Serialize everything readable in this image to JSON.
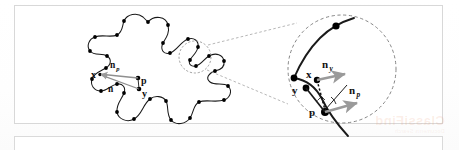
{
  "figure": {
    "caption_visible": false,
    "background_color": "#ffffff",
    "frame_color": "#d8d8d8",
    "curve_color": "#111111",
    "control_point_color": "#000000",
    "arrow_color": "#8f8f8f",
    "dashed_color": "#7a7a7a",
    "left_shape": {
      "name": "closed-spline-blob",
      "labels": [
        {
          "id": "x",
          "text": "x",
          "sub": "",
          "x": 93,
          "y": 74
        },
        {
          "id": "np",
          "text": "n",
          "sub": "p",
          "x": 114,
          "y": 67
        },
        {
          "id": "ny",
          "text": "n",
          "sub": "y",
          "x": 112,
          "y": 90
        },
        {
          "id": "p",
          "text": "p",
          "sub": "",
          "x": 142,
          "y": 82
        },
        {
          "id": "y",
          "text": "y",
          "sub": "",
          "x": 143,
          "y": 95
        }
      ]
    },
    "inset": {
      "name": "magnified-detail-circle",
      "labels": [
        {
          "id": "ny-inset",
          "text": "n",
          "sub": "y",
          "x": 326,
          "y": 66
        },
        {
          "id": "x-inset",
          "text": "x",
          "sub": "",
          "x": 310,
          "y": 77
        },
        {
          "id": "y-inset",
          "text": "y",
          "sub": "",
          "x": 295,
          "y": 92
        },
        {
          "id": "np-inset",
          "text": "n",
          "sub": "p",
          "x": 352,
          "y": 92
        },
        {
          "id": "p-inset",
          "text": "p",
          "sub": "",
          "x": 313,
          "y": 114
        }
      ]
    },
    "watermark": {
      "text": "ClassiFind",
      "subtext": "Documents   Search"
    }
  }
}
